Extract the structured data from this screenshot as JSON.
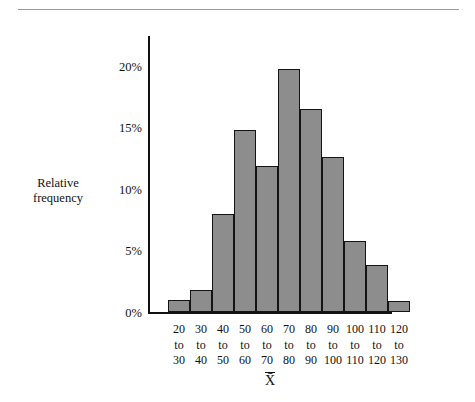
{
  "chart_data": {
    "type": "bar",
    "title": "",
    "subtitle": "",
    "xlabel": "X̄",
    "ylabel": "Relative frequency",
    "ylabel_lines": [
      "Relative",
      "frequency"
    ],
    "categories": [
      "20 to 30",
      "30 to 40",
      "40 to 50",
      "50 to 60",
      "60 to 70",
      "70 to 80",
      "80 to 90",
      "90 to 100",
      "100 to 110",
      "110 to 120",
      "120 to 130"
    ],
    "category_lines": [
      [
        "20",
        "to",
        "30"
      ],
      [
        "30",
        "to",
        "40"
      ],
      [
        "40",
        "to",
        "50"
      ],
      [
        "50",
        "to",
        "60"
      ],
      [
        "60",
        "to",
        "70"
      ],
      [
        "70",
        "to",
        "80"
      ],
      [
        "80",
        "to",
        "90"
      ],
      [
        "90",
        "to",
        "100"
      ],
      [
        "100",
        "to",
        "110"
      ],
      [
        "110",
        "to",
        "120"
      ],
      [
        "120",
        "to",
        "130"
      ]
    ],
    "values": [
      1.0,
      1.8,
      8.0,
      14.8,
      11.9,
      19.7,
      16.5,
      12.6,
      5.8,
      3.8,
      0.9
    ],
    "value_unit": "%",
    "ylim": [
      0,
      22.5
    ],
    "yticks": [
      0,
      5,
      10,
      15,
      20
    ],
    "ytick_labels": [
      "0%",
      "5%",
      "10%",
      "15%",
      "20%"
    ],
    "grid": false,
    "legend": null,
    "bar_fill_color": "#8d8d8d",
    "bar_edge_color": "#141414",
    "axis_color": "#121212"
  }
}
